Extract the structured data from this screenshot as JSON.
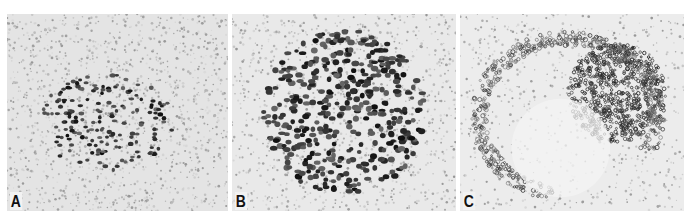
{
  "figure": {
    "panels": [
      {
        "id": "A",
        "label": "A",
        "stain": "sparse-nuclear",
        "cluster": {
          "cx": 0.45,
          "cy": 0.55,
          "rx": 0.3,
          "ry": 0.25,
          "count": 170,
          "dot": 2.4
        },
        "background_density": 1400,
        "seed": 11
      },
      {
        "id": "B",
        "label": "B",
        "stain": "dense-nuclear",
        "cluster": {
          "cx": 0.5,
          "cy": 0.5,
          "rx": 0.36,
          "ry": 0.42,
          "count": 420,
          "dot": 3.2
        },
        "background_density": 1100,
        "seed": 23
      },
      {
        "id": "C",
        "label": "C",
        "stain": "membranous-network",
        "cluster": {
          "cx": 0.7,
          "cy": 0.4,
          "rx": 0.22,
          "ry": 0.25,
          "count": 700,
          "dot": 1.6
        },
        "background_density": 700,
        "seed": 37
      }
    ]
  },
  "colors": {
    "background": "#ffffff",
    "tissue": "#e4e4e4",
    "nuclei_light": "#9a9a9a",
    "nuclei_dark": "#1a1a1a",
    "label": "#111111"
  }
}
